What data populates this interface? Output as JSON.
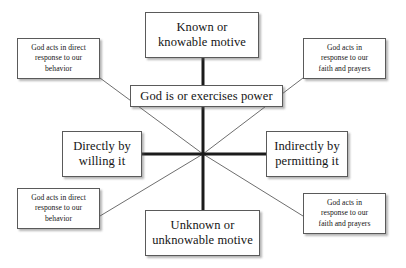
{
  "diagram": {
    "title": "God is or exercises power",
    "center_point": {
      "x": 203,
      "y": 154
    },
    "nodes": {
      "top": {
        "label": "Known or\nknowable motive"
      },
      "power": {
        "label": "God is or exercises power"
      },
      "left": {
        "label": "Directly by\nwilling it"
      },
      "right": {
        "label": "Indirectly by\npermitting it"
      },
      "bottom": {
        "label": "Unknown or\nunknowable motive"
      },
      "top_left": {
        "label": "God acts in direct\nresponse to our\nbehavior"
      },
      "top_right": {
        "label": "God acts in\nresponse to our\nfaith and prayers"
      },
      "bottom_left": {
        "label": "God acts in direct\nresponse to our\nbehavior"
      },
      "bottom_right": {
        "label": "God acts in\nresponse to our\nfaith and prayers"
      }
    },
    "colors": {
      "background": "#ffffff",
      "box_border": "#5a5a5a",
      "text": "#141414",
      "thick_edge": "#1b1b1b",
      "thin_edge": "#6e6e6e"
    },
    "edges": [
      {
        "name": "top-axis",
        "from": "top",
        "to": "center",
        "weight": "thick",
        "x1": 203,
        "y1": 58,
        "x2": 203,
        "y2": 154
      },
      {
        "name": "bottom-axis",
        "from": "center",
        "to": "bottom",
        "weight": "thick",
        "x1": 203,
        "y1": 154,
        "x2": 203,
        "y2": 210
      },
      {
        "name": "left-axis",
        "from": "left",
        "to": "center",
        "weight": "thick",
        "x1": 142,
        "y1": 154,
        "x2": 203,
        "y2": 154
      },
      {
        "name": "right-axis",
        "from": "center",
        "to": "right",
        "weight": "thick",
        "x1": 203,
        "y1": 154,
        "x2": 266,
        "y2": 154
      },
      {
        "name": "diagonal-top-left",
        "from": "top_left",
        "to": "center",
        "weight": "thin",
        "x1": 100,
        "y1": 78,
        "x2": 203,
        "y2": 154
      },
      {
        "name": "diagonal-top-right",
        "from": "top_right",
        "to": "center",
        "weight": "thin",
        "x1": 303,
        "y1": 78,
        "x2": 203,
        "y2": 154
      },
      {
        "name": "diagonal-bottom-left",
        "from": "bottom_left",
        "to": "center",
        "weight": "thin",
        "x1": 100,
        "y1": 216,
        "x2": 203,
        "y2": 154
      },
      {
        "name": "diagonal-bottom-right",
        "from": "bottom_right",
        "to": "center",
        "weight": "thin",
        "x1": 303,
        "y1": 216,
        "x2": 203,
        "y2": 154
      }
    ]
  }
}
